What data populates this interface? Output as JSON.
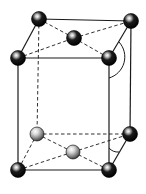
{
  "diagram": {
    "type": "body-centered tetragonal unit cell",
    "colors": {
      "background": "#ffffff",
      "line": "#1a1a1a",
      "atom_dark": "#0a0a0a",
      "atom_light": "#9a9a9a",
      "highlight": "#ffffff"
    },
    "atoms": [
      {
        "id": "top-back-left",
        "x": 39,
        "y": 19,
        "r": 7.5,
        "shade": "dark"
      },
      {
        "id": "top-back-right",
        "x": 131,
        "y": 21,
        "r": 7.5,
        "shade": "dark"
      },
      {
        "id": "top-front-left",
        "x": 18,
        "y": 58,
        "r": 7.5,
        "shade": "dark"
      },
      {
        "id": "top-front-right",
        "x": 109,
        "y": 58,
        "r": 7.5,
        "shade": "dark"
      },
      {
        "id": "top-face-center",
        "x": 74,
        "y": 38,
        "r": 7.5,
        "shade": "dark"
      },
      {
        "id": "bottom-back-left",
        "x": 37,
        "y": 134,
        "r": 7,
        "shade": "light"
      },
      {
        "id": "bottom-back-right",
        "x": 130,
        "y": 134,
        "r": 7.5,
        "shade": "dark"
      },
      {
        "id": "bottom-front-left",
        "x": 18,
        "y": 170,
        "r": 7.5,
        "shade": "dark"
      },
      {
        "id": "bottom-front-right",
        "x": 109,
        "y": 170,
        "r": 7.5,
        "shade": "dark"
      },
      {
        "id": "bottom-face-center",
        "x": 73,
        "y": 152,
        "r": 7,
        "shade": "light"
      }
    ],
    "solid_edges": [
      [
        39,
        19,
        131,
        21
      ],
      [
        39,
        19,
        18,
        58
      ],
      [
        18,
        58,
        109,
        58
      ],
      [
        131,
        21,
        109,
        58
      ],
      [
        18,
        58,
        18,
        170
      ],
      [
        109,
        58,
        109,
        170
      ],
      [
        131,
        21,
        130,
        134
      ],
      [
        18,
        170,
        109,
        170
      ],
      [
        109,
        170,
        130,
        134
      ]
    ],
    "dashed_edges": [
      [
        39,
        19,
        37,
        134
      ],
      [
        39,
        19,
        74,
        38
      ],
      [
        74,
        38,
        109,
        58
      ],
      [
        18,
        58,
        74,
        38
      ],
      [
        74,
        38,
        131,
        21
      ],
      [
        37,
        134,
        130,
        134
      ],
      [
        37,
        134,
        18,
        170
      ],
      [
        37,
        134,
        73,
        152
      ],
      [
        73,
        152,
        109,
        170
      ],
      [
        18,
        170,
        73,
        152
      ],
      [
        73,
        152,
        130,
        134
      ]
    ],
    "angle_arcs": [
      {
        "id": "top-angle",
        "path": "M 119 42 A 22 22 0 0 1 109 78"
      },
      {
        "id": "bottom-angle",
        "path": "M 109 148 A 12 12 0 0 0 119 152"
      }
    ]
  }
}
